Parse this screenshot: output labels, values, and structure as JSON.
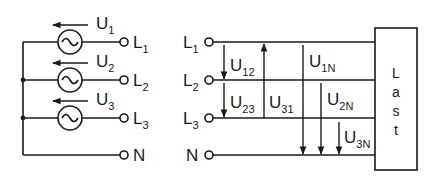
{
  "diagram": {
    "type": "three-phase-network",
    "colors": {
      "line": "#1a1a1a",
      "background": "#ffffff"
    },
    "source": {
      "voltages": [
        {
          "main": "U",
          "sub": "1"
        },
        {
          "main": "U",
          "sub": "2"
        },
        {
          "main": "U",
          "sub": "3"
        }
      ],
      "terminals": [
        {
          "main": "L",
          "sub": "1"
        },
        {
          "main": "L",
          "sub": "2"
        },
        {
          "main": "L",
          "sub": "3"
        },
        {
          "main": "N",
          "sub": ""
        }
      ],
      "generator_symbol": "ac-source-icon"
    },
    "network": {
      "terminals": [
        {
          "main": "L",
          "sub": "1"
        },
        {
          "main": "L",
          "sub": "2"
        },
        {
          "main": "L",
          "sub": "3"
        },
        {
          "main": "N",
          "sub": ""
        }
      ],
      "line_voltages": [
        {
          "main": "U",
          "sub": "12"
        },
        {
          "main": "U",
          "sub": "23"
        },
        {
          "main": "U",
          "sub": "31"
        }
      ],
      "phase_voltages": [
        {
          "main": "U",
          "sub": "1N"
        },
        {
          "main": "U",
          "sub": "2N"
        },
        {
          "main": "U",
          "sub": "3N"
        }
      ]
    },
    "load": {
      "label_letters": [
        "L",
        "a",
        "s",
        "t"
      ]
    }
  }
}
